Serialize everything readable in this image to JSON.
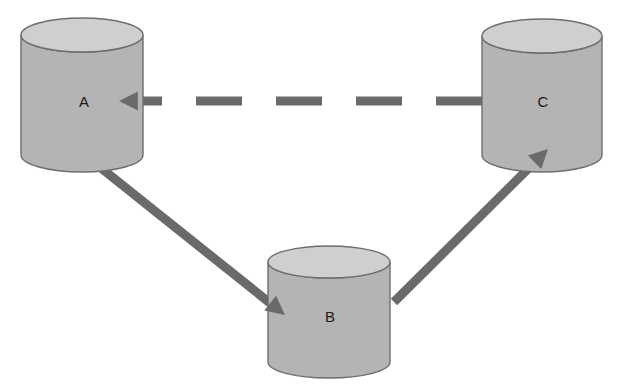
{
  "diagram": {
    "canvas": {
      "width": 622,
      "height": 391,
      "background": "#ffffff"
    },
    "style": {
      "cylinder_body_color": "#b4b4b4",
      "cylinder_top_color": "#cfcfcf",
      "cylinder_stroke_color": "#6e6e6e",
      "arrow_color": "#6a6a6a",
      "label_color": "#1a1a1a"
    },
    "nodes": [
      {
        "id": "A",
        "label": "A",
        "shape": "cylinder",
        "cx": 82,
        "cy": 95,
        "rx": 61,
        "top_y": 35,
        "bottom_y": 155,
        "ellipse_ry": 17,
        "label_x": 84,
        "label_y": 103
      },
      {
        "id": "B",
        "label": "B",
        "shape": "cylinder",
        "cx": 329,
        "cy": 311,
        "rx": 61,
        "top_y": 262,
        "bottom_y": 362,
        "ellipse_ry": 16,
        "label_x": 330,
        "label_y": 318
      },
      {
        "id": "C",
        "label": "C",
        "shape": "cylinder",
        "cx": 542,
        "cy": 95,
        "rx": 60,
        "top_y": 36,
        "bottom_y": 155,
        "ellipse_ry": 17,
        "label_x": 543,
        "label_y": 103
      }
    ],
    "edges": [
      {
        "id": "edge-a-b",
        "from": "A",
        "to": "B",
        "style": "solid",
        "direction": "forward",
        "x1": 86,
        "y1": 156,
        "x2": 285,
        "y2": 315,
        "width": 9,
        "arrowhead": "filled-triangle"
      },
      {
        "id": "edge-b-c",
        "from": "B",
        "to": "C",
        "style": "solid",
        "direction": "forward",
        "x1": 394,
        "y1": 302,
        "x2": 548,
        "y2": 149,
        "width": 9,
        "arrowhead": "filled-triangle"
      },
      {
        "id": "edge-c-a",
        "from": "C",
        "to": "A",
        "style": "dashed",
        "direction": "forward",
        "x1": 482,
        "y1": 101,
        "x2": 119,
        "y2": 101,
        "width": 9,
        "arrowhead": "filled-triangle",
        "dash_pattern": "46 34"
      }
    ]
  }
}
